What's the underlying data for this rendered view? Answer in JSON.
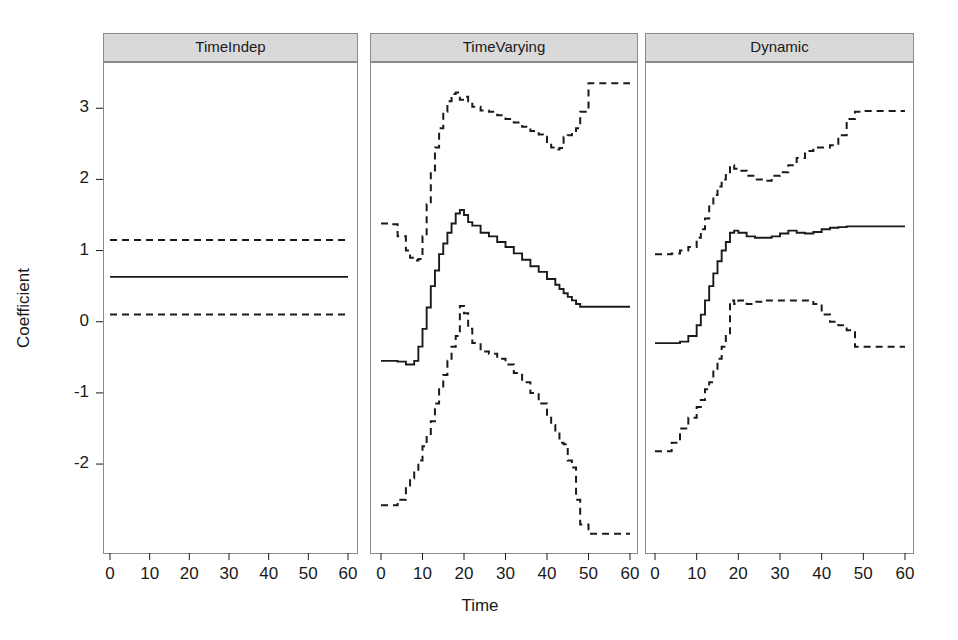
{
  "figure": {
    "ylabel": "Coefficient",
    "xlabel": "Time",
    "background": "#ffffff",
    "line_color": "#1a1a1a",
    "strip_fill": "#d9d9d9",
    "strip_border": "#8a8a8a",
    "panel_border": "#8a8a8a"
  },
  "axes": {
    "y_ticks": [
      "3",
      "2",
      "1",
      "0",
      "-1",
      "-2"
    ],
    "y_tick_values": [
      3,
      2,
      1,
      0,
      -1,
      -2
    ],
    "x_ticks": [
      "0",
      "10",
      "20",
      "30",
      "40",
      "50",
      "60"
    ],
    "x_tick_values": [
      0,
      10,
      20,
      30,
      40,
      50,
      60
    ],
    "ylim": [
      -3.25,
      3.65
    ],
    "xlim": [
      -2,
      64
    ]
  },
  "panels": [
    {
      "label": "TimeIndep"
    },
    {
      "label": "TimeVarying"
    },
    {
      "label": "Dynamic"
    }
  ],
  "chart_data": {
    "type": "line",
    "title": "",
    "xlabel": "Time",
    "ylabel": "Coefficient",
    "xlim": [
      -2,
      64
    ],
    "ylim": [
      -3.25,
      3.65
    ],
    "grid": false,
    "legend": "none",
    "layout": "3 horizontal facet panels sharing a common y-axis",
    "panel_strip_labels": [
      "TimeIndep",
      "TimeVarying",
      "Dynamic"
    ],
    "x_tick_labels": [
      "0",
      "10",
      "20",
      "30",
      "40",
      "50",
      "60"
    ],
    "y_tick_labels": [
      "3",
      "2",
      "1",
      "0",
      "-1",
      "-2"
    ],
    "line_styles": {
      "estimate": "solid",
      "upper_ci": "dashed",
      "lower_ci": "dashed"
    },
    "panels": [
      {
        "name": "TimeIndep",
        "series": [
          {
            "name": "upper_ci",
            "style": "dashed",
            "x": [
              0,
              60
            ],
            "values": [
              1.15,
              1.15
            ]
          },
          {
            "name": "estimate",
            "style": "solid",
            "x": [
              0,
              60
            ],
            "values": [
              0.63,
              0.63
            ]
          },
          {
            "name": "lower_ci",
            "style": "dashed",
            "x": [
              0,
              60
            ],
            "values": [
              0.1,
              0.1
            ]
          }
        ]
      },
      {
        "name": "TimeVarying",
        "series": [
          {
            "name": "upper_ci",
            "style": "dashed",
            "x": [
              0,
              2,
              4,
              6,
              7,
              8,
              9,
              10,
              11,
              12,
              13,
              14,
              15,
              16,
              17,
              18,
              19,
              20,
              21,
              22,
              24,
              26,
              28,
              30,
              32,
              34,
              36,
              38,
              39,
              40,
              41,
              42,
              43,
              44,
              45,
              46,
              47,
              48,
              50,
              55,
              60
            ],
            "values": [
              1.38,
              1.37,
              1.2,
              1.0,
              0.9,
              0.86,
              0.88,
              1.2,
              1.65,
              2.1,
              2.45,
              2.72,
              2.95,
              3.1,
              3.2,
              3.22,
              3.12,
              3.16,
              3.1,
              3.02,
              2.97,
              2.95,
              2.9,
              2.85,
              2.8,
              2.74,
              2.68,
              2.63,
              2.6,
              2.5,
              2.45,
              2.42,
              2.44,
              2.6,
              2.62,
              2.66,
              2.72,
              2.95,
              3.35,
              3.35,
              3.35
            ]
          },
          {
            "name": "estimate",
            "style": "solid",
            "x": [
              0,
              2,
              4,
              6,
              7,
              8,
              9,
              10,
              11,
              12,
              13,
              14,
              15,
              16,
              17,
              18,
              19,
              20,
              21,
              22,
              24,
              26,
              28,
              30,
              32,
              34,
              36,
              38,
              40,
              42,
              43,
              44,
              45,
              46,
              47,
              48,
              50,
              55,
              60
            ],
            "values": [
              -0.55,
              -0.55,
              -0.56,
              -0.6,
              -0.6,
              -0.55,
              -0.35,
              -0.1,
              0.2,
              0.5,
              0.72,
              0.95,
              1.1,
              1.25,
              1.38,
              1.52,
              1.57,
              1.5,
              1.4,
              1.35,
              1.25,
              1.2,
              1.12,
              1.05,
              0.96,
              0.87,
              0.78,
              0.7,
              0.6,
              0.52,
              0.46,
              0.4,
              0.35,
              0.3,
              0.25,
              0.21,
              0.21,
              0.21,
              0.21
            ]
          },
          {
            "name": "lower_ci",
            "style": "dashed",
            "x": [
              0,
              2,
              4,
              6,
              7,
              8,
              9,
              10,
              11,
              12,
              13,
              14,
              15,
              16,
              17,
              18,
              19,
              20,
              21,
              22,
              24,
              26,
              28,
              30,
              32,
              34,
              36,
              38,
              40,
              41,
              42,
              43,
              44,
              45,
              46,
              47,
              48,
              50,
              55,
              60
            ],
            "values": [
              -2.58,
              -2.58,
              -2.5,
              -2.3,
              -2.2,
              -2.1,
              -1.95,
              -1.75,
              -1.6,
              -1.4,
              -1.15,
              -0.95,
              -0.75,
              -0.55,
              -0.35,
              -0.2,
              0.22,
              0.12,
              -0.1,
              -0.3,
              -0.42,
              -0.45,
              -0.52,
              -0.6,
              -0.72,
              -0.85,
              -1.0,
              -1.15,
              -1.35,
              -1.45,
              -1.55,
              -1.7,
              -1.72,
              -1.95,
              -2.05,
              -2.5,
              -2.85,
              -2.98,
              -2.98,
              -2.98
            ]
          }
        ]
      },
      {
        "name": "Dynamic",
        "series": [
          {
            "name": "upper_ci",
            "style": "dashed",
            "x": [
              0,
              2,
              4,
              6,
              8,
              10,
              11,
              12,
              13,
              14,
              15,
              16,
              17,
              18,
              19,
              20,
              22,
              24,
              26,
              28,
              30,
              32,
              34,
              36,
              38,
              40,
              42,
              44,
              46,
              48,
              50,
              55,
              60
            ],
            "values": [
              0.95,
              0.95,
              0.96,
              1.0,
              1.05,
              1.18,
              1.3,
              1.45,
              1.62,
              1.78,
              1.9,
              2.0,
              2.08,
              2.2,
              2.15,
              2.12,
              2.05,
              2.0,
              1.98,
              2.05,
              2.1,
              2.2,
              2.3,
              2.4,
              2.45,
              2.45,
              2.48,
              2.62,
              2.85,
              2.95,
              2.96,
              2.96,
              2.96
            ]
          },
          {
            "name": "estimate",
            "style": "solid",
            "x": [
              0,
              2,
              4,
              6,
              8,
              10,
              11,
              12,
              13,
              14,
              15,
              16,
              17,
              18,
              19,
              20,
              22,
              24,
              26,
              28,
              30,
              32,
              34,
              36,
              38,
              40,
              42,
              44,
              46,
              48,
              50,
              55,
              60
            ],
            "values": [
              -0.3,
              -0.3,
              -0.3,
              -0.28,
              -0.2,
              -0.05,
              0.1,
              0.3,
              0.5,
              0.68,
              0.85,
              1.0,
              1.12,
              1.25,
              1.28,
              1.25,
              1.2,
              1.18,
              1.18,
              1.2,
              1.24,
              1.28,
              1.25,
              1.24,
              1.26,
              1.3,
              1.32,
              1.33,
              1.34,
              1.34,
              1.34,
              1.34,
              1.34
            ]
          },
          {
            "name": "lower_ci",
            "style": "dashed",
            "x": [
              0,
              2,
              4,
              6,
              8,
              10,
              11,
              12,
              13,
              14,
              15,
              16,
              17,
              18,
              19,
              20,
              22,
              24,
              26,
              28,
              30,
              32,
              34,
              36,
              38,
              40,
              42,
              44,
              46,
              48,
              50,
              55,
              60
            ],
            "values": [
              -1.82,
              -1.82,
              -1.7,
              -1.5,
              -1.35,
              -1.2,
              -1.1,
              -0.95,
              -0.85,
              -0.7,
              -0.52,
              -0.35,
              -0.18,
              0.3,
              0.25,
              0.3,
              0.25,
              0.28,
              0.3,
              0.3,
              0.3,
              0.3,
              0.3,
              0.3,
              0.25,
              0.1,
              0.0,
              -0.05,
              -0.12,
              -0.35,
              -0.35,
              -0.35,
              -0.35
            ]
          }
        ]
      }
    ]
  }
}
